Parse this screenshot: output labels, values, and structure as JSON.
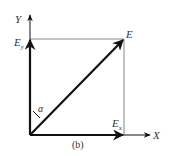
{
  "diagram": {
    "caption": "(b)",
    "labels": {
      "y_axis": "Y",
      "x_axis": "X",
      "vector": "E",
      "y_component": "E",
      "y_component_sub": "y",
      "x_component": "E",
      "x_component_sub": "x",
      "angle": "α"
    },
    "colors": {
      "stroke": "#111111",
      "guide": "#888888",
      "text": "#333333"
    }
  }
}
